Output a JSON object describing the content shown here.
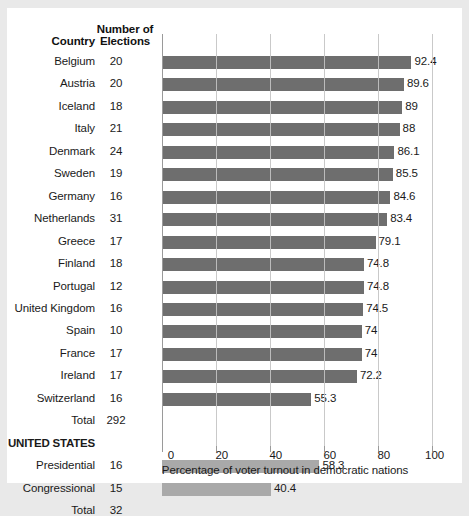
{
  "chart_data": {
    "type": "bar",
    "orientation": "horizontal",
    "title": "",
    "xlabel": "Percentage of voter turnout in democratic nations",
    "ylabel": "",
    "xlim": [
      0,
      100
    ],
    "xticks": [
      0,
      20,
      40,
      60,
      80,
      100
    ],
    "grid": true,
    "legend": false,
    "table_headers": {
      "country": "Country",
      "elections_line1": "Number of",
      "elections_line2": "Elections"
    },
    "categories": [
      "Belgium",
      "Austria",
      "Iceland",
      "Italy",
      "Denmark",
      "Sweden",
      "Germany",
      "Netherlands",
      "Greece",
      "Finland",
      "Portugal",
      "United Kingdom",
      "Spain",
      "France",
      "Ireland",
      "Switzerland",
      "Presidential",
      "Congressional"
    ],
    "values": [
      92.4,
      89.6,
      89,
      88,
      86.1,
      85.5,
      84.6,
      83.4,
      79.1,
      74.8,
      74.8,
      74.5,
      74,
      74,
      72.2,
      55.3,
      58.3,
      40.4
    ],
    "value_labels": [
      "92.4",
      "89.6",
      "89",
      "88",
      "86.1",
      "85.5",
      "84.6",
      "83.4",
      "79.1",
      "74.8",
      "74.8",
      "74.5",
      "74",
      "74",
      "72.2",
      "55.3",
      "58.3",
      "40.4"
    ],
    "elections": [
      "20",
      "20",
      "18",
      "21",
      "24",
      "19",
      "16",
      "31",
      "17",
      "18",
      "12",
      "16",
      "10",
      "17",
      "17",
      "16",
      "16",
      "15"
    ],
    "rows": [
      {
        "label": "Belgium",
        "elections": "20",
        "value": 92.4,
        "value_label": "92.4",
        "group": "europe"
      },
      {
        "label": "Austria",
        "elections": "20",
        "value": 89.6,
        "value_label": "89.6",
        "group": "europe"
      },
      {
        "label": "Iceland",
        "elections": "18",
        "value": 89,
        "value_label": "89",
        "group": "europe"
      },
      {
        "label": "Italy",
        "elections": "21",
        "value": 88,
        "value_label": "88",
        "group": "europe"
      },
      {
        "label": "Denmark",
        "elections": "24",
        "value": 86.1,
        "value_label": "86.1",
        "group": "europe"
      },
      {
        "label": "Sweden",
        "elections": "19",
        "value": 85.5,
        "value_label": "85.5",
        "group": "europe"
      },
      {
        "label": "Germany",
        "elections": "16",
        "value": 84.6,
        "value_label": "84.6",
        "group": "europe"
      },
      {
        "label": "Netherlands",
        "elections": "31",
        "value": 83.4,
        "value_label": "83.4",
        "group": "europe"
      },
      {
        "label": "Greece",
        "elections": "17",
        "value": 79.1,
        "value_label": "79.1",
        "group": "europe"
      },
      {
        "label": "Finland",
        "elections": "18",
        "value": 74.8,
        "value_label": "74.8",
        "group": "europe"
      },
      {
        "label": "Portugal",
        "elections": "12",
        "value": 74.8,
        "value_label": "74.8",
        "group": "europe"
      },
      {
        "label": "United Kingdom",
        "elections": "16",
        "value": 74.5,
        "value_label": "74.5",
        "group": "europe"
      },
      {
        "label": "Spain",
        "elections": "10",
        "value": 74,
        "value_label": "74",
        "group": "europe"
      },
      {
        "label": "France",
        "elections": "17",
        "value": 74,
        "value_label": "74",
        "group": "europe"
      },
      {
        "label": "Ireland",
        "elections": "17",
        "value": 72.2,
        "value_label": "72.2",
        "group": "europe"
      },
      {
        "label": "Switzerland",
        "elections": "16",
        "value": 55.3,
        "value_label": "55.3",
        "group": "europe"
      },
      {
        "label": "Total",
        "elections": "292",
        "value": null,
        "value_label": "",
        "group": "total"
      },
      {
        "label": "UNITED STATES",
        "elections": "",
        "value": null,
        "value_label": "",
        "group": "heading"
      },
      {
        "label": "Presidential",
        "elections": "16",
        "value": 58.3,
        "value_label": "58.3",
        "group": "us"
      },
      {
        "label": "Congressional",
        "elections": "15",
        "value": 40.4,
        "value_label": "40.4",
        "group": "us"
      },
      {
        "label": "Total",
        "elections": "32",
        "value": null,
        "value_label": "",
        "group": "total"
      }
    ],
    "colors": {
      "bar_europe": "#6e6e6e",
      "bar_us": "#a9a9a9",
      "gridline": "#c9c9c9",
      "axis": "#9a9a9a",
      "text": "#1a1a1a",
      "background": "#ffffff"
    }
  }
}
